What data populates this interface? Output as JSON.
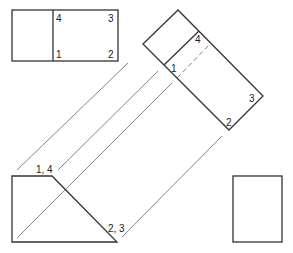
{
  "diagram": {
    "type": "orthographic-auxiliary-view",
    "views": {
      "top_view": {
        "labels": {
          "p4": "4",
          "p3": "3",
          "p1": "1",
          "p2": "2"
        }
      },
      "auxiliary_view": {
        "labels": {
          "p4": "4",
          "p1": "1",
          "p3": "3",
          "p2": "2"
        }
      },
      "front_view": {
        "labels": {
          "p14": "1, 4",
          "p23": "2, 3"
        }
      },
      "side_view": {}
    },
    "colors": {
      "outline": "#333333",
      "projection_line": "#666666",
      "background": "#ffffff"
    }
  }
}
